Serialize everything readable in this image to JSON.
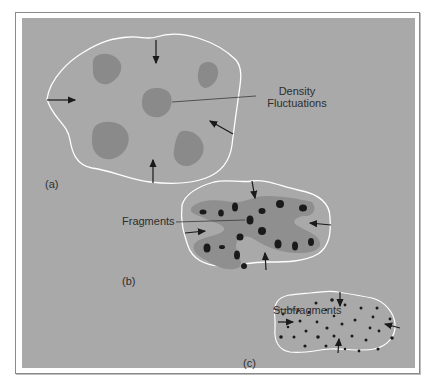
{
  "figure": {
    "panels": [
      {
        "id": "a",
        "label": "(a)",
        "description": "Cloud with density fluctuations"
      },
      {
        "id": "b",
        "label": "(b)",
        "description": "Cloud collapsing into fragments"
      },
      {
        "id": "c",
        "label": "(c)",
        "description": "Fragments breaking into subfragments"
      }
    ],
    "annotations": {
      "density_line1": "Density",
      "density_line2": "Fluctuations",
      "fragments": "Fragments",
      "subfragments": "Subfragments"
    },
    "colors": {
      "background": "#a9a9a9",
      "cloud_outline": "#ffffff",
      "density_blob": "#8a8a8a",
      "fragment_region": "#8f8f8f",
      "fragment_core": "#1a1a1a",
      "arrow": "#1a1a1a",
      "text": "#2e2e2e"
    }
  }
}
